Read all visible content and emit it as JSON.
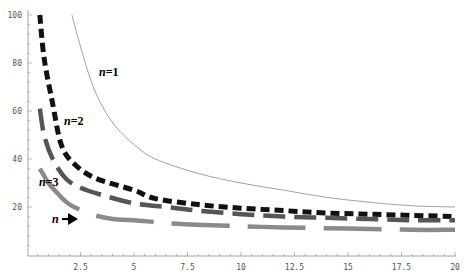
{
  "chart_data": {
    "type": "line",
    "title": "",
    "xlabel": "",
    "ylabel": "",
    "xlim": [
      0,
      20
    ],
    "ylim": [
      0,
      100
    ],
    "grid": false,
    "legend": "inline labels",
    "x_ticks": [
      2.5,
      5,
      7.5,
      10,
      12.5,
      15,
      17.5,
      20
    ],
    "x_tick_labels": [
      "2.5",
      "5",
      "7.5",
      "10",
      "12.5",
      "15",
      "17.5",
      "20"
    ],
    "y_ticks": [
      20,
      40,
      60,
      80,
      100
    ],
    "y_tick_labels": [
      "20",
      "40",
      "60",
      "80",
      "100"
    ],
    "series": [
      {
        "name": "n=1",
        "style": "thin solid",
        "color": "#888888",
        "x": [
          2.1,
          2.4,
          2.9,
          3.4,
          4.1,
          5.0,
          6.0,
          8.0,
          10,
          12,
          14,
          16,
          18,
          20
        ],
        "y": [
          100,
          90,
          75,
          64,
          54,
          46,
          40,
          34,
          30,
          27,
          24,
          22,
          20.5,
          20
        ]
      },
      {
        "name": "n=2",
        "style": "thick short dash",
        "color": "#111111",
        "x": [
          0.6,
          0.8,
          1.2,
          1.6,
          2.2,
          3.2,
          5.0,
          6.0,
          8.0,
          10,
          12,
          14,
          16,
          18,
          20
        ],
        "y": [
          100,
          82,
          63,
          46,
          38,
          32,
          27,
          23.5,
          21,
          19.5,
          18.5,
          17.5,
          17,
          16.5,
          16
        ]
      },
      {
        "name": "n=3",
        "style": "thick long dash",
        "color": "#555555",
        "x": [
          0.6,
          0.8,
          1.2,
          1.8,
          2.5,
          3.5,
          5,
          6.5,
          8,
          10,
          12,
          14,
          16,
          18,
          20
        ],
        "y": [
          61,
          50,
          40,
          32,
          28,
          25,
          21.5,
          20,
          18.5,
          17,
          16,
          15.5,
          15,
          14.5,
          14.5
        ]
      },
      {
        "name": "n→∞",
        "style": "thick very long dash",
        "color": "#8a8a8a",
        "x": [
          0.6,
          0.8,
          1.0,
          1.5,
          2.0,
          3.0,
          4.0,
          5.0,
          7.0,
          10,
          12,
          15,
          18,
          20
        ],
        "y": [
          36,
          33,
          30,
          25,
          21,
          17,
          15,
          14.5,
          13,
          12,
          11.5,
          11,
          10.5,
          10.5
        ]
      }
    ],
    "annotations": [
      {
        "text": "n=1",
        "x": 3.4,
        "y": 76
      },
      {
        "text": "n=2",
        "x": 1.8,
        "y": 55
      },
      {
        "text": "n=3",
        "x": 0.3,
        "y": 33
      },
      {
        "text": "n",
        "x": 1.2,
        "y": 15,
        "arrow": true
      }
    ]
  },
  "labels": {
    "n1": "n=1",
    "n2": "n=2",
    "n3": "n=3",
    "ninf": "n"
  }
}
